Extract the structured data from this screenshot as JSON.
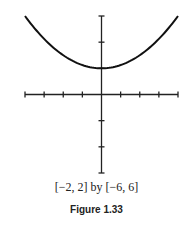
{
  "chart_data": {
    "type": "line",
    "title": "",
    "function": "y = x^2 + 2",
    "x": [
      -2,
      -1.5,
      -1,
      -0.5,
      0,
      0.5,
      1,
      1.5,
      2
    ],
    "series": [
      {
        "name": "curve",
        "values": [
          6,
          4.25,
          3,
          2.25,
          2,
          2.25,
          3,
          4.25,
          6
        ]
      }
    ],
    "xlim": [
      -2,
      2
    ],
    "ylim": [
      -6,
      6
    ],
    "xscale_ticks": 0.5,
    "yscale_ticks": 2,
    "grid": false,
    "legend": null,
    "xlabel": "",
    "ylabel": ""
  },
  "caption": {
    "window": "[−2, 2] by [−6, 6]",
    "figure": "Figure 1.33"
  },
  "colors": {
    "ink": "#111111"
  }
}
